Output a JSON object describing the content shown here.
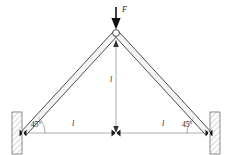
{
  "figure": {
    "type": "engineering-statics-diagram",
    "colors": {
      "member_stroke": "#3a3a3a",
      "member_fill": "#f2f2f2",
      "support_fill": "#f0f0f0",
      "support_stroke": "#6f6f6f",
      "hatch_stroke": "#9a9a9a",
      "dim_line": "#8a8a8a",
      "arrow_fill": "#111111",
      "text": "#1a1a1a"
    },
    "labels": {
      "force": "F",
      "height": "l",
      "half_span_left": "l",
      "half_span_right": "l",
      "angle_left": "45°",
      "angle_right": "45°"
    },
    "geometry": {
      "apex": [
        116,
        33
      ],
      "left_support": [
        22,
        133
      ],
      "right_support": [
        210,
        133
      ],
      "base_center": [
        116,
        133
      ],
      "member_half_width": 2.2,
      "angle_degrees": 45,
      "load_direction": "down"
    },
    "annotations": {
      "apex_joint": "pin-joint-circle",
      "base_joint": "bowtie-marker",
      "support_type": "hatched-wall-fixed"
    }
  }
}
